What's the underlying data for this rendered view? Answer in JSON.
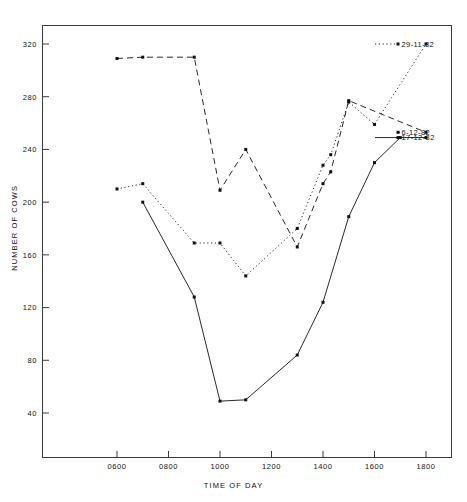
{
  "chart_data": {
    "type": "line",
    "title": "",
    "xlabel": "TIME OF DAY",
    "ylabel": "NUMBER OF COWS",
    "xlim": [
      500,
      1900
    ],
    "ylim": [
      0,
      340
    ],
    "xticks": [
      "0600",
      "0800",
      "1000",
      "1200",
      "1400",
      "1600",
      "1800"
    ],
    "xtick_values": [
      600,
      800,
      1000,
      1200,
      1400,
      1600,
      1800
    ],
    "yticks": [
      "40",
      "80",
      "120",
      "160",
      "200",
      "240",
      "280",
      "320"
    ],
    "ytick_values": [
      40,
      80,
      120,
      160,
      200,
      240,
      280,
      320
    ],
    "grid": false,
    "legend_position": "right-inside",
    "series": [
      {
        "name": "29-11-82",
        "style": "dotted",
        "color": "#111111",
        "x": [
          600,
          700,
          900,
          1000,
          1100,
          1300,
          1400,
          1430,
          1500,
          1600,
          1800
        ],
        "y": [
          210,
          214,
          169,
          169,
          144,
          180,
          228,
          236,
          276,
          259,
          320
        ]
      },
      {
        "name": "6-12-82",
        "style": "dashed",
        "color": "#111111",
        "x": [
          600,
          700,
          900,
          1000,
          1100,
          1300,
          1400,
          1430,
          1500,
          1800
        ],
        "y": [
          309,
          310,
          310,
          209,
          240,
          166,
          214,
          223,
          277,
          253
        ]
      },
      {
        "name": "17-12-82",
        "style": "solid",
        "color": "#111111",
        "x": [
          700,
          900,
          1000,
          1100,
          1300,
          1400,
          1500,
          1600,
          1700,
          1800
        ],
        "y": [
          200,
          128,
          49,
          50,
          84,
          124,
          189,
          230,
          249,
          249
        ]
      }
    ],
    "legend": [
      {
        "label": "29-11-82",
        "style": "dotted"
      },
      {
        "label": "6-12-82",
        "style": "dashed"
      },
      {
        "label": "17-12-82",
        "style": "solid"
      }
    ]
  }
}
